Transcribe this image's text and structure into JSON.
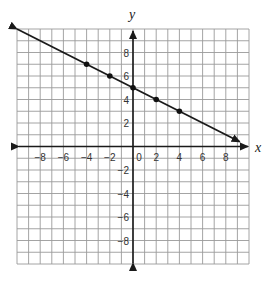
{
  "chart_data": {
    "type": "line",
    "title": "",
    "xlabel": "x",
    "ylabel": "y",
    "xlim": [
      -10,
      10
    ],
    "ylim": [
      -10,
      10
    ],
    "grid": true,
    "grid_step": 1,
    "x_tick_labels": [
      "-8",
      "-6",
      "-4",
      "-2",
      "0",
      "2",
      "4",
      "6",
      "8"
    ],
    "x_ticks": [
      -8,
      -6,
      -4,
      -2,
      0,
      2,
      4,
      6,
      8
    ],
    "y_tick_labels": [
      "8",
      "6",
      "4",
      "2",
      "-2",
      "-4",
      "-6",
      "-8"
    ],
    "y_ticks": [
      8,
      6,
      4,
      2,
      -2,
      -4,
      -6,
      -8
    ],
    "series": [
      {
        "name": "line",
        "equation": "y = -1/2 x + 5",
        "slope": -0.5,
        "intercept": 5,
        "points": [
          {
            "x": -4,
            "y": 7
          },
          {
            "x": -2,
            "y": 6
          },
          {
            "x": 0,
            "y": 5
          },
          {
            "x": 2,
            "y": 4
          },
          {
            "x": 4,
            "y": 3
          }
        ],
        "arrows": "both",
        "line_start": {
          "x": -10,
          "y": 10
        },
        "line_end": {
          "x": 9.2,
          "y": 0.4
        }
      }
    ],
    "legend": null
  },
  "labels": {
    "x_axis": "x",
    "y_axis": "y",
    "origin": "0"
  },
  "colors": {
    "grid": "#9a9a9a",
    "axis": "#1a1a1a",
    "line": "#1a1a1a",
    "points": "#111111",
    "background": "#ffffff"
  }
}
